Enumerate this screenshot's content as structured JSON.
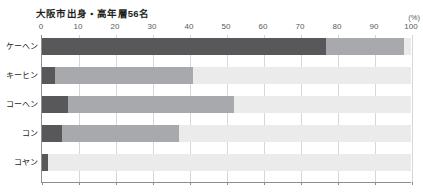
{
  "chart": {
    "title": "大阪市出身・高年層56名",
    "unit_label": "(%)"
  },
  "chart_data": {
    "type": "bar",
    "subtype": "stacked-horizontal-100",
    "title": "大阪市出身・高年層56名",
    "xlabel": "",
    "ylabel": "",
    "unit": "(%)",
    "xlim": [
      0,
      100
    ],
    "xticks": [
      0,
      10,
      20,
      30,
      40,
      50,
      60,
      70,
      80,
      90,
      100
    ],
    "xtick_labels": [
      "0",
      "10",
      "20",
      "30",
      "40",
      "50",
      "60",
      "70",
      "80",
      "90",
      "100"
    ],
    "grid": true,
    "grid_axis": "x",
    "legend": null,
    "legend_position": "none",
    "categories": [
      "ケーヘン",
      "キーヒン",
      "コーヘン",
      "コン",
      "コヤン"
    ],
    "series": [
      {
        "name": "segment-1",
        "color": "#58585a",
        "values": [
          77.0,
          3.5,
          7.0,
          5.5,
          1.5
        ]
      },
      {
        "name": "segment-2",
        "color": "#a7a9ac",
        "values": [
          21.0,
          37.5,
          45.0,
          31.5,
          0.0
        ]
      },
      {
        "name": "segment-3",
        "color": "#ebebeb",
        "values": [
          2.0,
          59.0,
          48.0,
          63.0,
          98.5
        ]
      }
    ],
    "cumulative_boundaries": [
      [
        77.0,
        98.0
      ],
      [
        3.5,
        41.0
      ],
      [
        7.0,
        52.0
      ],
      [
        5.5,
        37.0
      ],
      [
        1.5,
        1.5
      ]
    ]
  },
  "colors": {
    "segment_dark": "#58585a",
    "segment_medium": "#a7a9ac",
    "segment_light": "#ebebeb",
    "axis": "#8d8e90",
    "grid": "#d6d7d9",
    "text": "#231f20",
    "tick_text": "#58595b",
    "background": "#ffffff"
  }
}
